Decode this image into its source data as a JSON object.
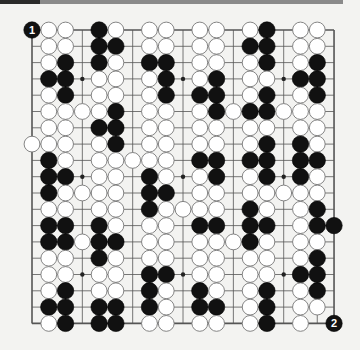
{
  "board": {
    "size": 19,
    "origin_x": 32,
    "origin_y": 30,
    "spacing_x": 16.78,
    "spacing_y": 16.3,
    "rows": [
      "BWW.BW.WW.WW.WB.WW.",
      ".WW.BB.WW.WW.BB.WW.",
      ".WB.BW.BB.WW.WB.WB.",
      ".BB.WW.WB.WB.WW.BB.",
      ".WB.WW.WB.BB.WB.WB.",
      ".WWWWB.WW.WBWBBWWW.",
      ".WW.BB.WW.WW.WW.WW.",
      "WWW.WB.WW.WW.WB.BW.",
      ".BW.WWWWW.BB.BB.BB.",
      ".BB.WW.BW.WB.WB.BW.",
      ".BWWWW.BB.WW.WWWWW.",
      ".WW.WW.BWWWW.BW.WB.",
      ".BB.BW.WW.BB.BB.WBB",
      ".BBWBB.WW.WWWBW.WW.",
      ".WW.BW.WW.WW.WW.WB.",
      ".WW.WW.BB.WW.WW.BB.",
      ".WB.WW.BW.BW.WB.WB.",
      ".BB.BB.BW.BB.WB.WW.",
      ".WB.BB.WW.WW.WB.W.B"
    ],
    "hoshi": [
      [
        3,
        3
      ],
      [
        3,
        9
      ],
      [
        3,
        15
      ],
      [
        9,
        3
      ],
      [
        9,
        9
      ],
      [
        9,
        15
      ],
      [
        15,
        3
      ],
      [
        15,
        9
      ],
      [
        15,
        15
      ]
    ],
    "move_labels": [
      {
        "row": 0,
        "col": 0,
        "color": "B",
        "label": "1"
      },
      {
        "row": 18,
        "col": 18,
        "color": "B",
        "label": "2"
      }
    ]
  },
  "colors": {
    "background": "#f3f3f1",
    "grid_line": "#555555",
    "black_stone": "#111111",
    "white_stone": "#ffffff",
    "white_stone_border": "#777777",
    "label_text": "#ffffff"
  }
}
